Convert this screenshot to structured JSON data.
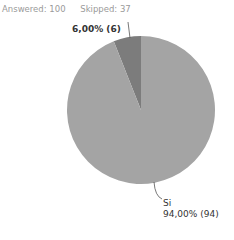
{
  "summary": {
    "answered_label": "Answered: 100",
    "skipped_label": "Skipped: 37"
  },
  "chart_data": {
    "type": "pie",
    "title": "",
    "categories": [
      "No",
      "Si"
    ],
    "values": [
      6,
      94
    ],
    "percentages": [
      "6,00%",
      "94,00%"
    ],
    "colors": [
      "#7c7c7c",
      "#a4a4a4"
    ],
    "labels": [
      {
        "category": "",
        "text": "6,00% (6)"
      },
      {
        "category": "Si",
        "text": "94,00% (94)"
      }
    ],
    "legend": "none"
  }
}
